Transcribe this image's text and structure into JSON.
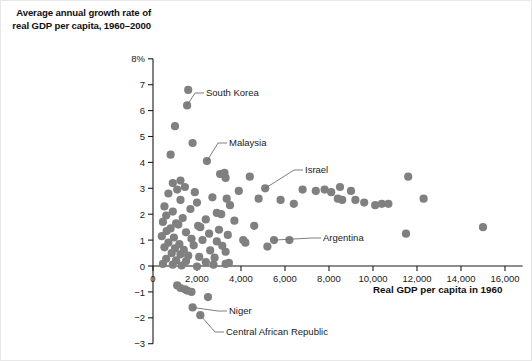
{
  "chart_data": {
    "type": "scatter",
    "title": "",
    "ylabel": "Average annual growth rate of real GDP per capita, 1960–2000",
    "xlabel": "Real GDP per capita in 1960",
    "xlim": [
      0,
      16800
    ],
    "ylim": [
      -3,
      8
    ],
    "grid": false,
    "legend": "none",
    "x_ticks": [
      0,
      2000,
      4000,
      6000,
      8000,
      10000,
      12000,
      14000,
      16000
    ],
    "x_tick_labels": [
      "0",
      "2,000",
      "4,000",
      "6,000",
      "8,000",
      "10,000",
      "12,000",
      "14,000",
      "16,000"
    ],
    "y_ticks": [
      8,
      7,
      6,
      5,
      4,
      3,
      2,
      1,
      0,
      -1,
      -2,
      -3
    ],
    "y_tick_labels": [
      "8%",
      "7",
      "6",
      "5",
      "4",
      "3",
      "2",
      "1",
      "0",
      "−1",
      "−2",
      "−3"
    ],
    "marker_color": "#808080",
    "axis_color": "#1a1a1a",
    "points": [
      [
        1600,
        6.8
      ],
      [
        1550,
        6.2
      ],
      [
        1000,
        5.4
      ],
      [
        1800,
        4.75
      ],
      [
        800,
        4.3
      ],
      [
        2450,
        4.05
      ],
      [
        3050,
        3.55
      ],
      [
        3250,
        3.6
      ],
      [
        3300,
        3.4
      ],
      [
        1250,
        3.3
      ],
      [
        900,
        3.2
      ],
      [
        1450,
        3.05
      ],
      [
        1100,
        2.95
      ],
      [
        1900,
        2.85
      ],
      [
        700,
        2.8
      ],
      [
        2700,
        2.65
      ],
      [
        3350,
        2.6
      ],
      [
        1250,
        2.55
      ],
      [
        2000,
        2.45
      ],
      [
        3500,
        2.35
      ],
      [
        520,
        2.3
      ],
      [
        1700,
        2.2
      ],
      [
        900,
        2.1
      ],
      [
        2900,
        2.05
      ],
      [
        3100,
        2.0
      ],
      [
        600,
        1.95
      ],
      [
        1350,
        1.85
      ],
      [
        2400,
        1.8
      ],
      [
        3700,
        1.75
      ],
      [
        450,
        1.7
      ],
      [
        1050,
        1.65
      ],
      [
        1150,
        1.6
      ],
      [
        2050,
        1.55
      ],
      [
        2150,
        1.5
      ],
      [
        800,
        1.45
      ],
      [
        3000,
        1.4
      ],
      [
        620,
        1.35
      ],
      [
        1500,
        1.3
      ],
      [
        2550,
        1.25
      ],
      [
        3400,
        1.2
      ],
      [
        400,
        1.15
      ],
      [
        950,
        1.1
      ],
      [
        1750,
        1.05
      ],
      [
        2250,
        1.0
      ],
      [
        2900,
        0.95
      ],
      [
        700,
        0.9
      ],
      [
        1200,
        0.85
      ],
      [
        1850,
        0.8
      ],
      [
        3150,
        0.78
      ],
      [
        520,
        0.72
      ],
      [
        1000,
        0.68
      ],
      [
        1400,
        0.62
      ],
      [
        2600,
        0.6
      ],
      [
        3300,
        0.55
      ],
      [
        850,
        0.5
      ],
      [
        1250,
        0.45
      ],
      [
        1600,
        0.4
      ],
      [
        2100,
        0.35
      ],
      [
        2800,
        0.32
      ],
      [
        600,
        0.28
      ],
      [
        1050,
        0.22
      ],
      [
        1500,
        0.18
      ],
      [
        2400,
        0.15
      ],
      [
        3450,
        0.12
      ],
      [
        450,
        0.08
      ],
      [
        900,
        0.05
      ],
      [
        1300,
        0.02
      ],
      [
        2000,
        -0.02
      ],
      [
        2750,
        0.05
      ],
      [
        3300,
        0.08
      ],
      [
        1100,
        -0.75
      ],
      [
        1250,
        -0.85
      ],
      [
        1450,
        -0.9
      ],
      [
        1550,
        -0.95
      ],
      [
        1750,
        -1.0
      ],
      [
        2500,
        -1.2
      ],
      [
        1800,
        -1.6
      ],
      [
        2150,
        -1.9
      ],
      [
        5500,
        1.0
      ],
      [
        4800,
        2.6
      ],
      [
        5100,
        3.0
      ],
      [
        6200,
        1.0
      ],
      [
        4200,
        0.9
      ],
      [
        5800,
        2.55
      ],
      [
        4600,
        1.55
      ],
      [
        6800,
        2.95
      ],
      [
        7400,
        2.9
      ],
      [
        7800,
        2.95
      ],
      [
        8100,
        2.85
      ],
      [
        8400,
        2.6
      ],
      [
        8500,
        3.05
      ],
      [
        8600,
        2.55
      ],
      [
        9000,
        2.9
      ],
      [
        9200,
        2.55
      ],
      [
        9600,
        2.45
      ],
      [
        10100,
        2.35
      ],
      [
        10400,
        2.4
      ],
      [
        10700,
        2.4
      ],
      [
        11600,
        3.45
      ],
      [
        11500,
        1.25
      ],
      [
        12300,
        2.6
      ],
      [
        15000,
        1.5
      ],
      [
        4400,
        3.45
      ],
      [
        3900,
        2.9
      ],
      [
        4100,
        1.0
      ],
      [
        5200,
        0.75
      ],
      [
        6400,
        2.4
      ]
    ],
    "annotations": [
      {
        "label": "South Korea",
        "point": [
          1550,
          6.2
        ],
        "label_x": 205,
        "label_y": 95
      },
      {
        "label": "Malaysia",
        "point": [
          2450,
          4.05
        ],
        "label_x": 228,
        "label_y": 145
      },
      {
        "label": "Israel",
        "point": [
          5100,
          3.0
        ],
        "label_x": 304,
        "label_y": 172
      },
      {
        "label": "Argentina",
        "point": [
          5500,
          1.0
        ],
        "label_x": 322,
        "label_y": 240
      },
      {
        "label": "Niger",
        "point": [
          1800,
          -1.6
        ],
        "label_x": 228,
        "label_y": 313
      },
      {
        "label": "Central African Republic",
        "point": [
          2150,
          -1.9
        ],
        "label_x": 225,
        "label_y": 334
      }
    ]
  }
}
